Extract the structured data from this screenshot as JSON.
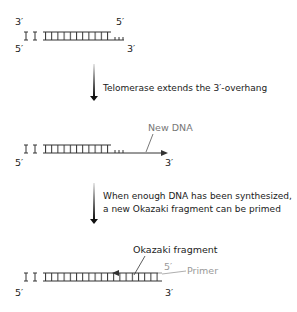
{
  "stage1": {
    "top_left": "3′",
    "top_right": "5′",
    "bottom_left": "5′",
    "bottom_right": "3′"
  },
  "step1": {
    "caption": "Telomerase extends the 3′-overhang"
  },
  "stage2": {
    "new_dna_label": "New DNA",
    "bottom_left": "5′",
    "bottom_right": "3′"
  },
  "step2": {
    "caption_line1": "When enough DNA has been synthesized,",
    "caption_line2": "a new Okazaki fragment can be primed"
  },
  "stage3": {
    "okazaki_label": "Okazaki fragment",
    "primer_label": "Primer",
    "primer_5prime": "5′",
    "bottom_left": "5′",
    "bottom_right": "3′"
  },
  "colors": {
    "strand": "#333333",
    "primer": "#999999",
    "arrow_top": "#dddddd",
    "arrow_bottom": "#111111"
  }
}
